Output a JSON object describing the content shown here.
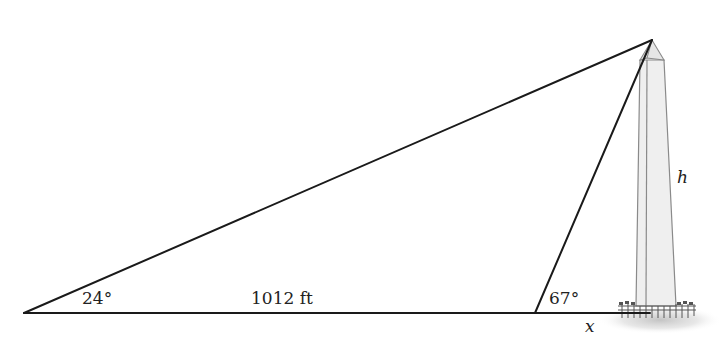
{
  "diagram": {
    "labels": {
      "angle_left": "24°",
      "angle_right": "67°",
      "base_distance": "1012 ft",
      "x_distance": "x",
      "height": "h"
    },
    "colors": {
      "line": "#1a1a1a",
      "obelisk_fill": "#efefef",
      "obelisk_outline": "#8a8a8a",
      "shadow": "#cfcfcf"
    },
    "geometry": {
      "left_vertex": [
        24,
        313
      ],
      "middle_vertex": [
        535,
        313
      ],
      "apex": [
        652,
        40
      ],
      "base_end": [
        640,
        313
      ]
    }
  }
}
